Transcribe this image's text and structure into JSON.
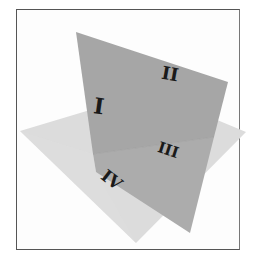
{
  "figure": {
    "regions": [
      {
        "id": "I",
        "label": "I"
      },
      {
        "id": "II",
        "label": "II"
      },
      {
        "id": "III",
        "label": "III"
      },
      {
        "id": "IV",
        "label": "IV"
      }
    ],
    "colors": {
      "frame": "#555555",
      "vertical_plane": "#a8a8a8",
      "vertical_plane_below": "#b4b4b4",
      "horizontal_plane": "#dcdcdc",
      "label": "#1a1a1a"
    }
  }
}
